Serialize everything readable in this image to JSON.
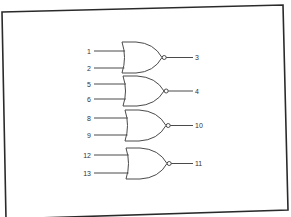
{
  "diagram": {
    "type": "logic-gate-schematic",
    "gate_type": "NOR",
    "colors": {
      "background": "#ffffff",
      "border": "#2a2a2a",
      "line": "#4a4a4a",
      "text": "#333333"
    },
    "gates": [
      {
        "id": "gate-1",
        "inputs": [
          {
            "label": "1",
            "y": 51
          },
          {
            "label": "2",
            "y": 68
          }
        ],
        "output": {
          "label": "3"
        },
        "top": 42,
        "bottom": 73,
        "back_x": 122,
        "tip_x": 162,
        "bubble_y": 57
      },
      {
        "id": "gate-2",
        "inputs": [
          {
            "label": "5",
            "y": 84
          },
          {
            "label": "6",
            "y": 99
          }
        ],
        "output": {
          "label": "4"
        },
        "top": 76,
        "bottom": 106,
        "back_x": 123,
        "tip_x": 164,
        "bubble_y": 89
      },
      {
        "id": "gate-3",
        "inputs": [
          {
            "label": "8",
            "y": 118
          },
          {
            "label": "9",
            "y": 135
          }
        ],
        "output": {
          "label": "10"
        },
        "top": 110,
        "bottom": 141,
        "back_x": 125,
        "tip_x": 166,
        "bubble_y": 124
      },
      {
        "id": "gate-4",
        "inputs": [
          {
            "label": "12",
            "y": 155
          },
          {
            "label": "13",
            "y": 173
          }
        ],
        "output": {
          "label": "11"
        },
        "top": 148,
        "bottom": 179,
        "back_x": 126,
        "tip_x": 167,
        "bubble_y": 162
      }
    ]
  }
}
